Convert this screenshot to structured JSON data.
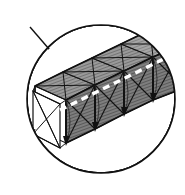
{
  "figure": {
    "reference_label": "12",
    "caption": "",
    "kind": "patent-line-drawing"
  },
  "colors": {
    "ink": "#1a1a1a",
    "outline": "#000000",
    "panel_fill": "#8a8a8a",
    "panel_fill_dark": "#6f6f6f",
    "panel_fill_light": "#9a9a9a",
    "background": "#ffffff",
    "cable": "#ffffff"
  },
  "callout": {
    "name": "detail-circle",
    "cx": 101,
    "cy": 99,
    "r": 74,
    "stroke_width": 1.6
  },
  "truss": {
    "bay_count": 4,
    "cross_section": "square",
    "bracing": "x-diagonal",
    "end_face": {
      "name": "open-end-bay",
      "fill": "none",
      "diagonals": 4
    },
    "cable": {
      "name": "deployment-cable",
      "style": "dashed",
      "color": "#ffffff",
      "dash": "7 5",
      "width": 3.2
    }
  },
  "geometry": {
    "axis_start": [
      60,
      110
    ],
    "axis_end": [
      180,
      50
    ],
    "bay_length": 30,
    "section_half_width": 26
  }
}
